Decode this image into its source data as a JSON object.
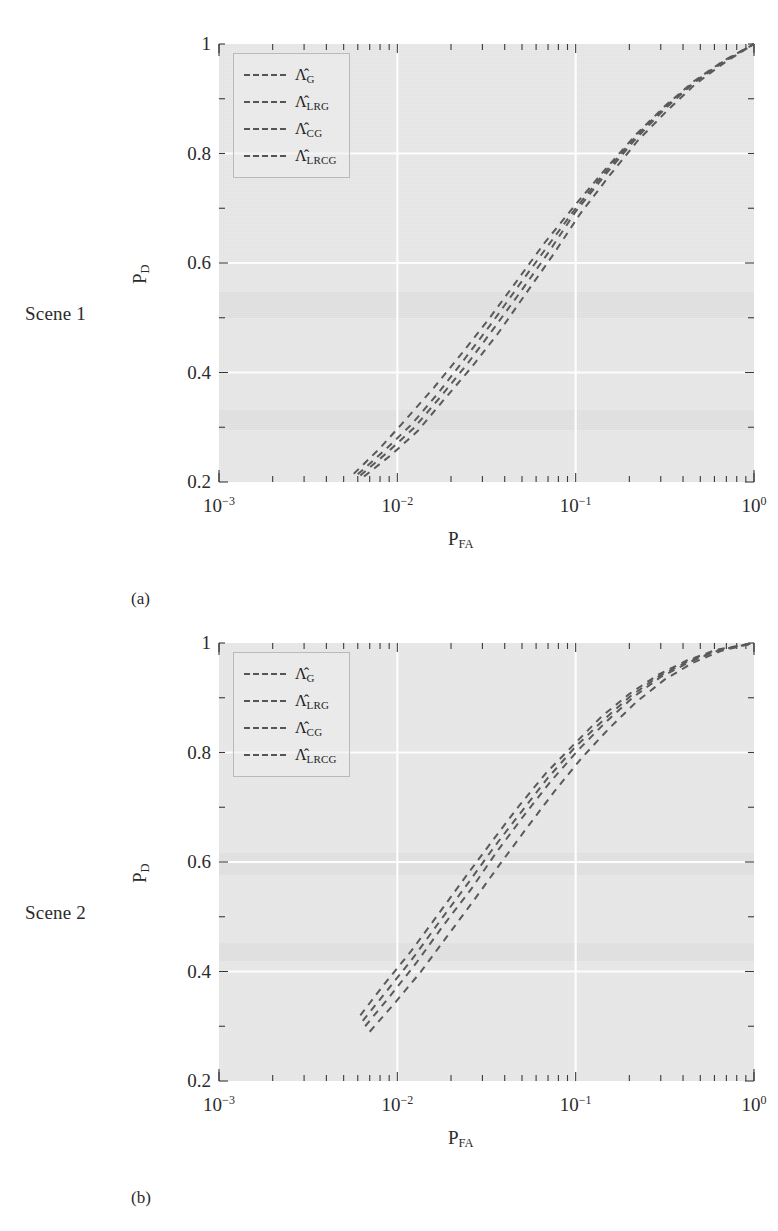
{
  "figure": {
    "panels": [
      {
        "id": "a",
        "row_label": "Scene 1",
        "caption": "(a)",
        "legend": [
          {
            "symbol": "Λ",
            "hat": true,
            "sub": "G"
          },
          {
            "symbol": "Λ",
            "hat": true,
            "sub": "LRG"
          },
          {
            "symbol": "Λ",
            "hat": true,
            "sub": "CG"
          },
          {
            "symbol": "Λ",
            "hat": true,
            "sub": "LRCG"
          }
        ]
      },
      {
        "id": "b",
        "row_label": "Scene 2",
        "caption": "(b)",
        "legend": [
          {
            "symbol": "Λ",
            "hat": true,
            "sub": "G"
          },
          {
            "symbol": "Λ",
            "hat": true,
            "sub": "LRG"
          },
          {
            "symbol": "Λ",
            "hat": true,
            "sub": "CG"
          },
          {
            "symbol": "Λ",
            "hat": true,
            "sub": "LRCG"
          }
        ]
      }
    ],
    "colors": {
      "plot_background": "#e9e9e9",
      "gridline": "#fdfdfd",
      "curve": "#5a5a5a",
      "text": "#2b2b2b",
      "legend_border": "#b9b9b9"
    }
  },
  "chart_data": [
    {
      "type": "line",
      "title": "",
      "subtitle": "Scene 1",
      "caption": "(a)",
      "xlabel": "P_FA",
      "ylabel": "P_D",
      "xscale": "log",
      "yscale": "linear",
      "xlim": [
        0.001,
        1.0
      ],
      "ylim": [
        0.2,
        1.0
      ],
      "xticks": [
        0.001,
        0.01,
        0.1,
        1.0
      ],
      "xticklabels": [
        "10−3",
        "10−2",
        "10−1",
        "10⁰"
      ],
      "yticks": [
        0.2,
        0.4,
        0.6,
        0.8,
        1.0
      ],
      "yticklabels": [
        "0.2",
        "0.4",
        "0.6",
        "0.8",
        "1"
      ],
      "grid": true,
      "legend_position": "upper left",
      "series": [
        {
          "name": "Λ̂_G",
          "x": [
            0.0057,
            0.008,
            0.011,
            0.016,
            0.023,
            0.033,
            0.047,
            0.067,
            0.1,
            0.15,
            0.22,
            0.32,
            0.46,
            0.68,
            1.0
          ],
          "y": [
            0.215,
            0.262,
            0.312,
            0.372,
            0.435,
            0.5,
            0.568,
            0.637,
            0.707,
            0.775,
            0.836,
            0.888,
            0.932,
            0.97,
            1.0
          ]
        },
        {
          "name": "Λ̂_LRG",
          "x": [
            0.006,
            0.0085,
            0.012,
            0.017,
            0.024,
            0.034,
            0.048,
            0.069,
            0.1,
            0.15,
            0.22,
            0.32,
            0.46,
            0.68,
            1.0
          ],
          "y": [
            0.214,
            0.258,
            0.305,
            0.363,
            0.426,
            0.491,
            0.559,
            0.629,
            0.7,
            0.77,
            0.833,
            0.886,
            0.93,
            0.969,
            1.0
          ]
        },
        {
          "name": "Λ̂_CG",
          "x": [
            0.0062,
            0.0088,
            0.0125,
            0.0175,
            0.025,
            0.035,
            0.05,
            0.071,
            0.1,
            0.15,
            0.22,
            0.32,
            0.46,
            0.68,
            1.0
          ],
          "y": [
            0.212,
            0.254,
            0.3,
            0.356,
            0.418,
            0.482,
            0.551,
            0.621,
            0.694,
            0.765,
            0.829,
            0.883,
            0.929,
            0.968,
            1.0
          ]
        },
        {
          "name": "Λ̂_LRCG",
          "x": [
            0.0065,
            0.0092,
            0.013,
            0.018,
            0.026,
            0.037,
            0.052,
            0.074,
            0.105,
            0.155,
            0.225,
            0.33,
            0.47,
            0.69,
            1.0
          ],
          "y": [
            0.21,
            0.249,
            0.293,
            0.348,
            0.409,
            0.473,
            0.542,
            0.613,
            0.688,
            0.76,
            0.825,
            0.88,
            0.927,
            0.967,
            1.0
          ]
        }
      ]
    },
    {
      "type": "line",
      "title": "",
      "subtitle": "Scene 2",
      "caption": "(b)",
      "xlabel": "P_FA",
      "ylabel": "P_D",
      "xscale": "log",
      "yscale": "linear",
      "xlim": [
        0.001,
        1.0
      ],
      "ylim": [
        0.2,
        1.0
      ],
      "xticks": [
        0.001,
        0.01,
        0.1,
        1.0
      ],
      "xticklabels": [
        "10−3",
        "10−2",
        "10−1",
        "10⁰"
      ],
      "yticks": [
        0.2,
        0.4,
        0.6,
        0.8,
        1.0
      ],
      "yticklabels": [
        "0.2",
        "0.4",
        "0.6",
        "0.8",
        "1"
      ],
      "grid": true,
      "legend_position": "upper left",
      "series": [
        {
          "name": "Λ̂_G",
          "x": [
            0.0062,
            0.0085,
            0.012,
            0.017,
            0.024,
            0.034,
            0.048,
            0.068,
            0.1,
            0.14,
            0.2,
            0.29,
            0.42,
            0.62,
            1.0
          ],
          "y": [
            0.32,
            0.378,
            0.438,
            0.505,
            0.572,
            0.638,
            0.702,
            0.762,
            0.818,
            0.866,
            0.907,
            0.942,
            0.968,
            0.988,
            1.0
          ]
        },
        {
          "name": "Λ̂_LRG",
          "x": [
            0.0064,
            0.0088,
            0.0124,
            0.0175,
            0.025,
            0.035,
            0.05,
            0.07,
            0.1,
            0.145,
            0.205,
            0.295,
            0.43,
            0.63,
            1.0
          ],
          "y": [
            0.31,
            0.366,
            0.427,
            0.494,
            0.562,
            0.628,
            0.693,
            0.754,
            0.811,
            0.861,
            0.904,
            0.94,
            0.967,
            0.987,
            1.0
          ]
        },
        {
          "name": "Λ̂_CG",
          "x": [
            0.0066,
            0.0091,
            0.0128,
            0.018,
            0.026,
            0.036,
            0.051,
            0.072,
            0.103,
            0.148,
            0.21,
            0.3,
            0.44,
            0.64,
            1.0
          ],
          "y": [
            0.3,
            0.355,
            0.416,
            0.483,
            0.551,
            0.618,
            0.684,
            0.746,
            0.804,
            0.856,
            0.901,
            0.938,
            0.966,
            0.987,
            1.0
          ]
        },
        {
          "name": "Λ̂_LRCG",
          "x": [
            0.007,
            0.0096,
            0.0135,
            0.019,
            0.027,
            0.038,
            0.054,
            0.076,
            0.108,
            0.155,
            0.22,
            0.315,
            0.455,
            0.66,
            1.0
          ],
          "y": [
            0.29,
            0.341,
            0.399,
            0.464,
            0.531,
            0.598,
            0.665,
            0.729,
            0.79,
            0.845,
            0.893,
            0.933,
            0.964,
            0.986,
            1.0
          ]
        }
      ]
    }
  ]
}
